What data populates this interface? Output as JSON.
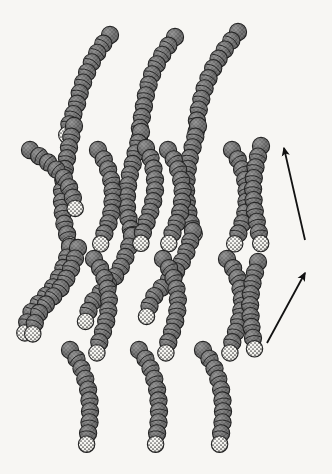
{
  "figure": {
    "background_color": "#f7f6f3",
    "ink_color": "#1a1a1a"
  },
  "legend_colors": {
    "tail_bead_fill": "#6e6e6e",
    "tail_bead_shade": "#5a5a5a",
    "tail_bead_outline": "#1d1d1d",
    "head_bead_fill": "#f2f1ec",
    "head_bead_stipple": "#333333",
    "head_bead_outline": "#1d1d1d",
    "arrow_color": "#111111"
  },
  "geometry": {
    "bead_radius": 8.6,
    "bead_spacing": 11.0,
    "head_radius": 8.2
  },
  "arrows": [
    {
      "name": "upper-direction-arrow",
      "label": "",
      "tail_x": 305,
      "tail_y": 240,
      "tip_x": 284,
      "tip_y": 148,
      "head_size": 11
    },
    {
      "name": "lower-direction-arrow",
      "label": "",
      "tail_x": 267,
      "tail_y": 343,
      "tip_x": 305,
      "tip_y": 273,
      "head_size": 11
    }
  ],
  "chains": [
    {
      "id": "chain-01",
      "head_end": "tail",
      "points": [
        [
          110,
          35
        ],
        [
          100,
          48
        ],
        [
          92,
          62
        ],
        [
          85,
          77
        ],
        [
          80,
          92
        ],
        [
          76,
          108
        ],
        [
          70,
          122
        ],
        [
          66,
          138
        ]
      ]
    },
    {
      "id": "chain-02",
      "head_end": "tail",
      "points": [
        [
          74,
          126
        ],
        [
          70,
          142
        ],
        [
          67,
          158
        ],
        [
          64,
          174
        ],
        [
          62,
          190
        ],
        [
          62,
          206
        ],
        [
          64,
          222
        ],
        [
          68,
          238
        ],
        [
          72,
          253
        ]
      ]
    },
    {
      "id": "chain-03",
      "head_end": "tail",
      "points": [
        [
          70,
          247
        ],
        [
          66,
          262
        ],
        [
          60,
          276
        ],
        [
          52,
          289
        ],
        [
          42,
          300
        ],
        [
          32,
          311
        ],
        [
          26,
          325
        ],
        [
          24,
          340
        ]
      ]
    },
    {
      "id": "chain-04",
      "head_end": "tail",
      "points": [
        [
          175,
          37
        ],
        [
          165,
          50
        ],
        [
          157,
          64
        ],
        [
          150,
          79
        ],
        [
          146,
          95
        ],
        [
          143,
          111
        ],
        [
          140,
          127
        ],
        [
          139,
          143
        ]
      ]
    },
    {
      "id": "chain-05",
      "head_end": "tail",
      "points": [
        [
          141,
          132
        ],
        [
          137,
          148
        ],
        [
          133,
          163
        ],
        [
          129,
          178
        ],
        [
          127,
          194
        ],
        [
          127,
          210
        ],
        [
          130,
          226
        ],
        [
          134,
          241
        ]
      ]
    },
    {
      "id": "chain-06",
      "head_end": "tail",
      "points": [
        [
          132,
          236
        ],
        [
          128,
          251
        ],
        [
          122,
          265
        ],
        [
          114,
          278
        ],
        [
          104,
          289
        ],
        [
          94,
          300
        ],
        [
          87,
          314
        ],
        [
          84,
          329
        ]
      ]
    },
    {
      "id": "chain-07",
      "head_end": "tail",
      "points": [
        [
          238,
          32
        ],
        [
          228,
          45
        ],
        [
          219,
          58
        ],
        [
          211,
          72
        ],
        [
          205,
          87
        ],
        [
          200,
          103
        ],
        [
          197,
          119
        ],
        [
          196,
          135
        ]
      ]
    },
    {
      "id": "chain-08",
      "head_end": "tail",
      "points": [
        [
          198,
          126
        ],
        [
          194,
          142
        ],
        [
          190,
          157
        ],
        [
          187,
          173
        ],
        [
          186,
          189
        ],
        [
          187,
          205
        ],
        [
          190,
          221
        ],
        [
          195,
          236
        ]
      ]
    },
    {
      "id": "chain-09",
      "head_end": "tail",
      "points": [
        [
          193,
          231
        ],
        [
          189,
          246
        ],
        [
          183,
          260
        ],
        [
          175,
          273
        ],
        [
          165,
          284
        ],
        [
          155,
          295
        ],
        [
          148,
          309
        ],
        [
          145,
          324
        ]
      ]
    },
    {
      "id": "chain-10",
      "head_end": "tail",
      "points": [
        [
          30,
          150
        ],
        [
          42,
          158
        ],
        [
          54,
          167
        ],
        [
          64,
          178
        ],
        [
          71,
          191
        ],
        [
          75,
          205
        ],
        [
          76,
          219
        ]
      ]
    },
    {
      "id": "chain-11",
      "head_end": "tail",
      "points": [
        [
          98,
          150
        ],
        [
          106,
          163
        ],
        [
          111,
          178
        ],
        [
          113,
          194
        ],
        [
          112,
          210
        ],
        [
          108,
          225
        ],
        [
          102,
          239
        ],
        [
          98,
          254
        ]
      ]
    },
    {
      "id": "chain-12",
      "head_end": "tail",
      "points": [
        [
          168,
          150
        ],
        [
          176,
          163
        ],
        [
          181,
          178
        ],
        [
          183,
          194
        ],
        [
          181,
          210
        ],
        [
          176,
          225
        ],
        [
          170,
          239
        ],
        [
          166,
          254
        ]
      ]
    },
    {
      "id": "chain-13",
      "head_end": "tail",
      "points": [
        [
          232,
          150
        ],
        [
          240,
          163
        ],
        [
          245,
          178
        ],
        [
          247,
          194
        ],
        [
          246,
          210
        ],
        [
          242,
          225
        ],
        [
          236,
          239
        ],
        [
          232,
          254
        ]
      ]
    },
    {
      "id": "chain-14",
      "head_end": "tail",
      "points": [
        [
          261,
          146
        ],
        [
          257,
          160
        ],
        [
          254,
          175
        ],
        [
          253,
          191
        ],
        [
          254,
          207
        ],
        [
          257,
          223
        ],
        [
          260,
          238
        ],
        [
          262,
          254
        ]
      ]
    },
    {
      "id": "chain-15",
      "head_end": "tail",
      "points": [
        [
          146,
          148
        ],
        [
          152,
          161
        ],
        [
          155,
          176
        ],
        [
          155,
          192
        ],
        [
          152,
          207
        ],
        [
          147,
          221
        ],
        [
          142,
          235
        ],
        [
          140,
          250
        ]
      ]
    },
    {
      "id": "chain-16",
      "head_end": "tail",
      "points": [
        [
          94,
          259
        ],
        [
          102,
          271
        ],
        [
          107,
          285
        ],
        [
          109,
          300
        ],
        [
          108,
          315
        ],
        [
          104,
          329
        ],
        [
          99,
          343
        ],
        [
          96,
          357
        ]
      ]
    },
    {
      "id": "chain-17",
      "head_end": "tail",
      "points": [
        [
          163,
          259
        ],
        [
          171,
          271
        ],
        [
          176,
          285
        ],
        [
          178,
          300
        ],
        [
          177,
          315
        ],
        [
          173,
          329
        ],
        [
          168,
          343
        ],
        [
          165,
          357
        ]
      ]
    },
    {
      "id": "chain-18",
      "head_end": "tail",
      "points": [
        [
          227,
          259
        ],
        [
          235,
          271
        ],
        [
          240,
          285
        ],
        [
          242,
          300
        ],
        [
          241,
          315
        ],
        [
          237,
          329
        ],
        [
          232,
          343
        ],
        [
          229,
          357
        ]
      ]
    },
    {
      "id": "chain-19",
      "head_end": "tail",
      "points": [
        [
          258,
          262
        ],
        [
          254,
          276
        ],
        [
          251,
          291
        ],
        [
          250,
          307
        ],
        [
          251,
          323
        ],
        [
          253,
          338
        ],
        [
          255,
          352
        ]
      ]
    },
    {
      "id": "chain-20",
      "head_end": "tail",
      "points": [
        [
          78,
          248
        ],
        [
          74,
          262
        ],
        [
          68,
          276
        ],
        [
          60,
          289
        ],
        [
          50,
          300
        ],
        [
          40,
          311
        ],
        [
          34,
          325
        ],
        [
          32,
          340
        ]
      ]
    },
    {
      "id": "chain-21",
      "head_end": "tail",
      "points": [
        [
          70,
          350
        ],
        [
          78,
          361
        ],
        [
          84,
          374
        ],
        [
          88,
          389
        ],
        [
          90,
          404
        ],
        [
          90,
          419
        ],
        [
          88,
          434
        ],
        [
          86,
          449
        ]
      ]
    },
    {
      "id": "chain-22",
      "head_end": "tail",
      "points": [
        [
          139,
          350
        ],
        [
          147,
          361
        ],
        [
          153,
          374
        ],
        [
          157,
          389
        ],
        [
          159,
          404
        ],
        [
          159,
          419
        ],
        [
          157,
          434
        ],
        [
          155,
          449
        ]
      ]
    },
    {
      "id": "chain-23",
      "head_end": "tail",
      "points": [
        [
          203,
          350
        ],
        [
          211,
          361
        ],
        [
          217,
          374
        ],
        [
          221,
          389
        ],
        [
          223,
          404
        ],
        [
          223,
          419
        ],
        [
          221,
          434
        ],
        [
          219,
          449
        ]
      ]
    }
  ]
}
